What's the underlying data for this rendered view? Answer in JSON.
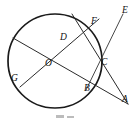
{
  "figure": {
    "type": "geometry-diagram",
    "width": 137,
    "height": 123,
    "stroke_color": "#1a1a1a",
    "background_color": "#ffffff",
    "circle": {
      "name": "main-circle",
      "center_label": "O",
      "cx": 55,
      "cy": 61,
      "r": 47
    },
    "points": [
      {
        "id": "A",
        "label": "A",
        "x": 128,
        "y": 104,
        "label_x": 122,
        "label_y": 98
      },
      {
        "id": "B",
        "label": "B",
        "x": 89,
        "y": 86,
        "label_x": 85,
        "label_y": 86
      },
      {
        "id": "C",
        "label": "C",
        "x": 99,
        "y": 69,
        "label_x": 101,
        "label_y": 62
      },
      {
        "id": "D",
        "label": "D",
        "x": 67,
        "y": 43,
        "label_x": 61,
        "label_y": 36
      },
      {
        "id": "E",
        "label": "E",
        "x": 122,
        "y": 17,
        "label_x": 122,
        "label_y": 9
      },
      {
        "id": "F",
        "label": "F",
        "x": 91,
        "y": 27,
        "label_x": 92,
        "label_y": 20
      },
      {
        "id": "G",
        "label": "G",
        "x": 20,
        "y": 87,
        "label_x": 11,
        "label_y": 78
      },
      {
        "id": "O",
        "label": "O",
        "x": 55,
        "y": 61,
        "label_x": 47,
        "label_y": 62
      }
    ],
    "segments": [
      {
        "id": "top-to-A",
        "from": "H",
        "to": "A",
        "x1": 72,
        "y1": 14,
        "x2": 128,
        "y2": 104
      },
      {
        "id": "G-to-F",
        "from": "G",
        "to": "F",
        "x1": 20,
        "y1": 87,
        "x2": 99,
        "y2": 19
      },
      {
        "id": "left-to-A",
        "from": "K",
        "to": "A",
        "x1": 13,
        "y1": 38,
        "x2": 128,
        "y2": 104
      },
      {
        "id": "B-to-E",
        "from": "B",
        "to": "E",
        "x1": 86,
        "y1": 90,
        "x2": 123,
        "y2": 14
      }
    ],
    "caption": ""
  }
}
